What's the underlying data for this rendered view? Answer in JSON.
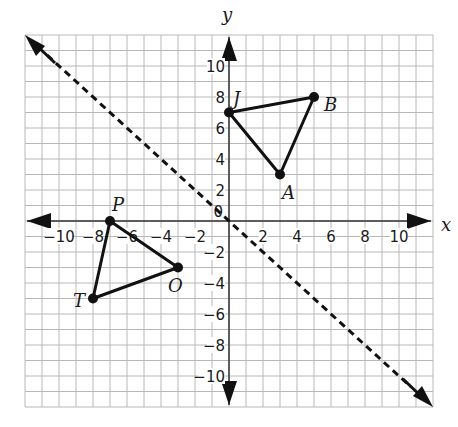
{
  "axes": {
    "x_label": "x",
    "y_label": "y",
    "x_range": [
      -12,
      12
    ],
    "y_range": [
      -12,
      12
    ],
    "x_ticks": [
      {
        "value": -10,
        "label": "−10"
      },
      {
        "value": -8,
        "label": "−8"
      },
      {
        "value": -6,
        "label": "−6"
      },
      {
        "value": -4,
        "label": "−4"
      },
      {
        "value": -2,
        "label": "−2"
      },
      {
        "value": 2,
        "label": "2"
      },
      {
        "value": 4,
        "label": "4"
      },
      {
        "value": 6,
        "label": "6"
      },
      {
        "value": 8,
        "label": "8"
      },
      {
        "value": 10,
        "label": "10"
      }
    ],
    "y_ticks": [
      {
        "value": 10,
        "label": "10"
      },
      {
        "value": 8,
        "label": "8"
      },
      {
        "value": 6,
        "label": "6"
      },
      {
        "value": 4,
        "label": "4"
      },
      {
        "value": 2,
        "label": "2"
      },
      {
        "value": -2,
        "label": "−2"
      },
      {
        "value": -4,
        "label": "−4"
      },
      {
        "value": -6,
        "label": "−6"
      },
      {
        "value": -8,
        "label": "−8"
      },
      {
        "value": -10,
        "label": "−10"
      }
    ],
    "origin_label": "0"
  },
  "triangles": [
    {
      "name": "JBA",
      "vertices": [
        {
          "label": "J",
          "x": 0,
          "y": 7
        },
        {
          "label": "B",
          "x": 5,
          "y": 8
        },
        {
          "label": "A",
          "x": 3,
          "y": 3
        }
      ]
    },
    {
      "name": "PTO",
      "vertices": [
        {
          "label": "P",
          "x": -7,
          "y": 0
        },
        {
          "label": "O",
          "x": -3,
          "y": -3
        },
        {
          "label": "T",
          "x": -8,
          "y": -5
        }
      ]
    }
  ],
  "reflection_line": {
    "equation": "y = -x",
    "style": "dashed",
    "from": [
      -12,
      12
    ],
    "to": [
      12,
      -12
    ]
  },
  "colors": {
    "grid": "#b8b8b8",
    "ink": "#111111"
  }
}
